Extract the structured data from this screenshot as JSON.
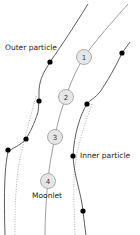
{
  "diagram": {
    "labels": {
      "outer_particle": "Outer particle",
      "inner_particle": "Inner particle",
      "moonlet": "Moonlet"
    },
    "moonlet_positions": [
      {
        "label": "1",
        "x": 84,
        "y": 57
      },
      {
        "label": "2",
        "x": 66,
        "y": 97
      },
      {
        "label": "3",
        "x": 55,
        "y": 137
      },
      {
        "label": "4",
        "x": 48,
        "y": 181
      }
    ],
    "colors": {
      "moonlet_fill": "#e6e6e6",
      "moonlet_stroke": "#999999",
      "particle_path": "#333333",
      "moonlet_path": "#888888",
      "dotted_path": "#888888",
      "marker": "#000000"
    }
  }
}
